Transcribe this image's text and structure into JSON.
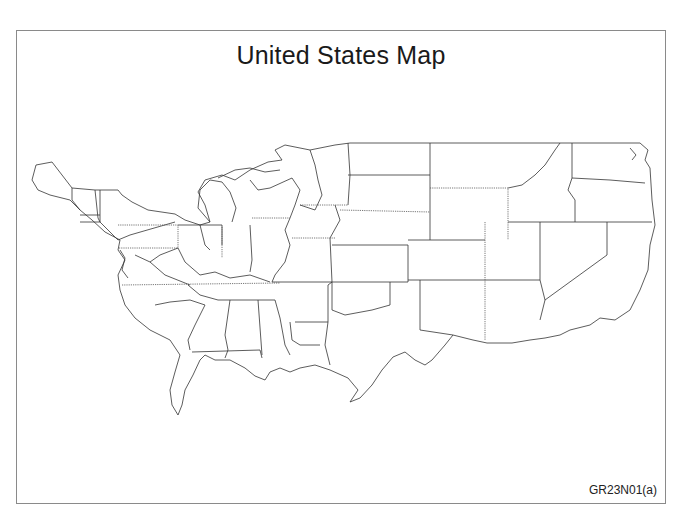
{
  "figure": {
    "title": "United States Map",
    "figure_id": "GR23N01(a)",
    "orientation": "horizontally mirrored (east coast on left, west coast on right)",
    "frame_color": "#8a8a8a",
    "line_color": "#333333"
  },
  "map": {
    "type": "outline",
    "region": "Contiguous United States",
    "boundaries": "state borders, no labels, no fill"
  }
}
